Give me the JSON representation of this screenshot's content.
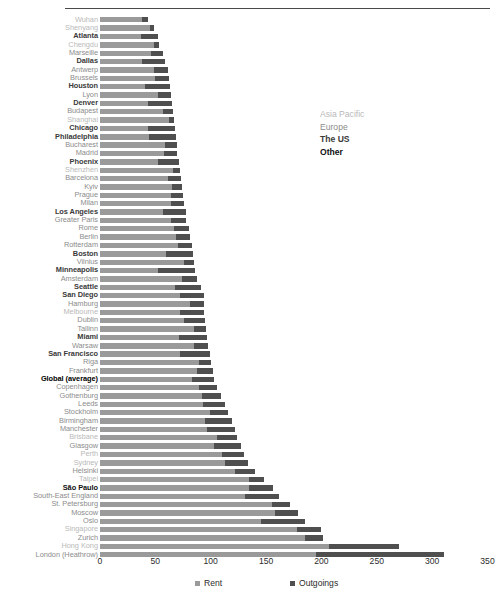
{
  "chart_data": {
    "type": "bar",
    "orientation": "horizontal",
    "stacked": true,
    "title": "",
    "xlabel": "",
    "ylabel": "",
    "xlim": [
      0,
      350
    ],
    "xticks": [
      0,
      50,
      100,
      150,
      200,
      250,
      300,
      350
    ],
    "grid": false,
    "legend_position": "bottom",
    "series": [
      {
        "name": "Rent",
        "color": "#9a9a9a"
      },
      {
        "name": "Outgoings",
        "color": "#4f4f4f"
      }
    ],
    "category_legend": {
      "position": "inside-top-right",
      "entries": [
        {
          "label": "Asia Pacific",
          "color": "#b9b9b9"
        },
        {
          "label": "Europe",
          "color": "#8c8c8c"
        },
        {
          "label": "The US",
          "color": "#3a3a3a"
        },
        {
          "label": "Other",
          "color": "#111111"
        }
      ]
    },
    "categories": [
      "Wuhan",
      "Shenyang",
      "Atlanta",
      "Chengdu",
      "Marseille",
      "Dallas",
      "Antwerp",
      "Brussels",
      "Houston",
      "Lyon",
      "Denver",
      "Budapest",
      "Shanghai",
      "Chicago",
      "Philadelphia",
      "Bucharest",
      "Madrid",
      "Phoenix",
      "Shenzhen",
      "Barcelona",
      "Kyiv",
      "Prague",
      "Milan",
      "Los Angeles",
      "Greater Paris",
      "Rome",
      "Berlin",
      "Rotterdam",
      "Boston",
      "Vilnius",
      "Minneapolis",
      "Amsterdam",
      "Seattle",
      "San Diego",
      "Hamburg",
      "Melbourne",
      "Dublin",
      "Tallinn",
      "Miami",
      "Warsaw",
      "San Francisco",
      "Riga",
      "Frankfurt",
      "Global (average)",
      "Copenhagen",
      "Gothenburg",
      "Leeds",
      "Stockholm",
      "Birmingham",
      "Manchester",
      "Brisbane",
      "Glasgow",
      "Perth",
      "Sydney",
      "Helsinki",
      "Taipei",
      "São Paulo",
      "South-East England",
      "St. Petersburg",
      "Moscow",
      "Oslo",
      "Singapore",
      "Zurich",
      "Hong Kong",
      "London (Heathrow)"
    ],
    "rows": [
      {
        "label": "Wuhan",
        "group": "asia",
        "rent": 38,
        "outgoings": 5
      },
      {
        "label": "Shenyang",
        "group": "asia",
        "rent": 45,
        "outgoings": 4
      },
      {
        "label": "Atlanta",
        "group": "us",
        "rent": 37,
        "outgoings": 15
      },
      {
        "label": "Chengdu",
        "group": "asia",
        "rent": 49,
        "outgoings": 4
      },
      {
        "label": "Marseille",
        "group": "europe",
        "rent": 46,
        "outgoings": 11
      },
      {
        "label": "Dallas",
        "group": "us",
        "rent": 38,
        "outgoings": 21
      },
      {
        "label": "Antwerp",
        "group": "europe",
        "rent": 49,
        "outgoings": 12
      },
      {
        "label": "Brussels",
        "group": "europe",
        "rent": 50,
        "outgoings": 12
      },
      {
        "label": "Houston",
        "group": "us",
        "rent": 41,
        "outgoings": 22
      },
      {
        "label": "Lyon",
        "group": "europe",
        "rent": 52,
        "outgoings": 12
      },
      {
        "label": "Denver",
        "group": "us",
        "rent": 43,
        "outgoings": 22
      },
      {
        "label": "Budapest",
        "group": "europe",
        "rent": 57,
        "outgoings": 9
      },
      {
        "label": "Shanghai",
        "group": "asia",
        "rent": 62,
        "outgoings": 5
      },
      {
        "label": "Chicago",
        "group": "us",
        "rent": 43,
        "outgoings": 25
      },
      {
        "label": "Philadelphia",
        "group": "us",
        "rent": 44,
        "outgoings": 25
      },
      {
        "label": "Bucharest",
        "group": "europe",
        "rent": 59,
        "outgoings": 11
      },
      {
        "label": "Madrid",
        "group": "europe",
        "rent": 58,
        "outgoings": 12
      },
      {
        "label": "Phoenix",
        "group": "us",
        "rent": 52,
        "outgoings": 19
      },
      {
        "label": "Shenzhen",
        "group": "asia",
        "rent": 66,
        "outgoings": 6
      },
      {
        "label": "Barcelona",
        "group": "europe",
        "rent": 61,
        "outgoings": 12
      },
      {
        "label": "Kyiv",
        "group": "europe",
        "rent": 65,
        "outgoings": 9
      },
      {
        "label": "Prague",
        "group": "europe",
        "rent": 64,
        "outgoings": 11
      },
      {
        "label": "Milan",
        "group": "europe",
        "rent": 64,
        "outgoings": 12
      },
      {
        "label": "Los Angeles",
        "group": "us",
        "rent": 57,
        "outgoings": 21
      },
      {
        "label": "Greater Paris",
        "group": "europe",
        "rent": 64,
        "outgoings": 14
      },
      {
        "label": "Rome",
        "group": "europe",
        "rent": 67,
        "outgoings": 13
      },
      {
        "label": "Berlin",
        "group": "europe",
        "rent": 69,
        "outgoings": 12
      },
      {
        "label": "Rotterdam",
        "group": "europe",
        "rent": 70,
        "outgoings": 13
      },
      {
        "label": "Boston",
        "group": "us",
        "rent": 60,
        "outgoings": 24
      },
      {
        "label": "Vilnius",
        "group": "europe",
        "rent": 76,
        "outgoings": 9
      },
      {
        "label": "Minneapolis",
        "group": "us",
        "rent": 52,
        "outgoings": 34
      },
      {
        "label": "Amsterdam",
        "group": "europe",
        "rent": 74,
        "outgoings": 14
      },
      {
        "label": "Seattle",
        "group": "us",
        "rent": 68,
        "outgoings": 23
      },
      {
        "label": "San Diego",
        "group": "us",
        "rent": 72,
        "outgoings": 22
      },
      {
        "label": "Hamburg",
        "group": "europe",
        "rent": 81,
        "outgoings": 13
      },
      {
        "label": "Melbourne",
        "group": "asia",
        "rent": 72,
        "outgoings": 22
      },
      {
        "label": "Dublin",
        "group": "europe",
        "rent": 76,
        "outgoings": 19
      },
      {
        "label": "Tallinn",
        "group": "europe",
        "rent": 85,
        "outgoings": 11
      },
      {
        "label": "Miami",
        "group": "us",
        "rent": 71,
        "outgoings": 26
      },
      {
        "label": "Warsaw",
        "group": "europe",
        "rent": 85,
        "outgoings": 13
      },
      {
        "label": "San Francisco",
        "group": "us",
        "rent": 72,
        "outgoings": 27
      },
      {
        "label": "Riga",
        "group": "europe",
        "rent": 89,
        "outgoings": 11
      },
      {
        "label": "Frankfurt",
        "group": "europe",
        "rent": 88,
        "outgoings": 14
      },
      {
        "label": "Global (average)",
        "group": "global",
        "rent": 83,
        "outgoings": 20
      },
      {
        "label": "Copenhagen",
        "group": "europe",
        "rent": 89,
        "outgoings": 17
      },
      {
        "label": "Gothenburg",
        "group": "europe",
        "rent": 92,
        "outgoings": 17
      },
      {
        "label": "Leeds",
        "group": "europe",
        "rent": 93,
        "outgoings": 20
      },
      {
        "label": "Stockholm",
        "group": "europe",
        "rent": 99,
        "outgoings": 17
      },
      {
        "label": "Birmingham",
        "group": "europe",
        "rent": 95,
        "outgoings": 24
      },
      {
        "label": "Manchester",
        "group": "europe",
        "rent": 97,
        "outgoings": 25
      },
      {
        "label": "Brisbane",
        "group": "asia",
        "rent": 106,
        "outgoings": 18
      },
      {
        "label": "Glasgow",
        "group": "europe",
        "rent": 103,
        "outgoings": 24
      },
      {
        "label": "Perth",
        "group": "asia",
        "rent": 110,
        "outgoings": 20
      },
      {
        "label": "Sydney",
        "group": "asia",
        "rent": 113,
        "outgoings": 21
      },
      {
        "label": "Helsinki",
        "group": "europe",
        "rent": 122,
        "outgoings": 18
      },
      {
        "label": "Taipei",
        "group": "asia",
        "rent": 135,
        "outgoings": 13
      },
      {
        "label": "São Paulo",
        "group": "other",
        "rent": 135,
        "outgoings": 21
      },
      {
        "label": "South-East England",
        "group": "europe",
        "rent": 131,
        "outgoings": 31
      },
      {
        "label": "St. Petersburg",
        "group": "europe",
        "rent": 155,
        "outgoings": 17
      },
      {
        "label": "Moscow",
        "group": "europe",
        "rent": 158,
        "outgoings": 21
      },
      {
        "label": "Oslo",
        "group": "europe",
        "rent": 145,
        "outgoings": 40
      },
      {
        "label": "Singapore",
        "group": "asia",
        "rent": 178,
        "outgoings": 22
      },
      {
        "label": "Zurich",
        "group": "europe",
        "rent": 185,
        "outgoings": 16
      },
      {
        "label": "Hong Kong",
        "group": "asia",
        "rent": 207,
        "outgoings": 63
      },
      {
        "label": "London (Heathrow)",
        "group": "europe",
        "rent": 195,
        "outgoings": 116
      }
    ]
  }
}
